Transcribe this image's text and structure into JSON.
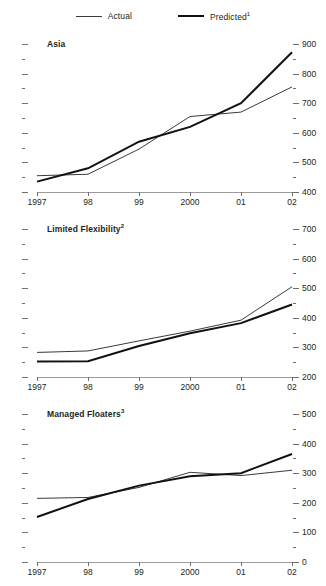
{
  "legend": {
    "items": [
      {
        "name": "actual",
        "label": "Actual",
        "style": "thin",
        "color": "#3b3b3b"
      },
      {
        "name": "predicted",
        "label": "Predicted",
        "sup": "1",
        "style": "thick",
        "color": "#111111"
      }
    ]
  },
  "x_categories": [
    "1997",
    "98",
    "99",
    "2000",
    "01",
    "02"
  ],
  "chart_data": [
    {
      "type": "line",
      "title": "Asia",
      "title_sup": "",
      "xlabel": "",
      "ylabel": "",
      "ylim": [
        400,
        900
      ],
      "yticks": [
        400,
        500,
        600,
        700,
        800,
        900
      ],
      "yticklabels": [
        "400",
        "500",
        "600",
        "700",
        "800",
        "900"
      ],
      "minor_ticks": true,
      "grid": false,
      "legend_position": "top-center",
      "categories": [
        "1997",
        "98",
        "99",
        "2000",
        "01",
        "02"
      ],
      "series": [
        {
          "name": "Actual",
          "values": [
            455,
            460,
            545,
            655,
            670,
            755
          ]
        },
        {
          "name": "Predicted",
          "values": [
            435,
            480,
            570,
            620,
            700,
            872
          ]
        }
      ]
    },
    {
      "type": "line",
      "title": "Limited Flexibility",
      "title_sup": "2",
      "xlabel": "",
      "ylabel": "",
      "ylim": [
        200,
        700
      ],
      "yticks": [
        200,
        300,
        400,
        500,
        600,
        700
      ],
      "yticklabels": [
        "200",
        "300",
        "400",
        "500",
        "600",
        "700"
      ],
      "minor_ticks": true,
      "grid": false,
      "categories": [
        "1997",
        "98",
        "99",
        "2000",
        "01",
        "02"
      ],
      "series": [
        {
          "name": "Actual",
          "values": [
            283,
            288,
            322,
            355,
            392,
            505
          ]
        },
        {
          "name": "Predicted",
          "values": [
            252,
            253,
            305,
            348,
            382,
            445
          ]
        }
      ]
    },
    {
      "type": "line",
      "title": "Managed Floaters",
      "title_sup": "3",
      "xlabel": "",
      "ylabel": "",
      "ylim": [
        0,
        500
      ],
      "yticks": [
        0,
        100,
        200,
        300,
        400,
        500
      ],
      "yticklabels": [
        "0",
        "100",
        "200",
        "300",
        "400",
        "500"
      ],
      "minor_ticks": true,
      "grid": false,
      "categories": [
        "1997",
        "98",
        "99",
        "2000",
        "01",
        "02"
      ],
      "series": [
        {
          "name": "Actual",
          "values": [
            215,
            218,
            252,
            303,
            292,
            310
          ]
        },
        {
          "name": "Predicted",
          "values": [
            152,
            213,
            258,
            290,
            300,
            365
          ]
        }
      ]
    }
  ]
}
